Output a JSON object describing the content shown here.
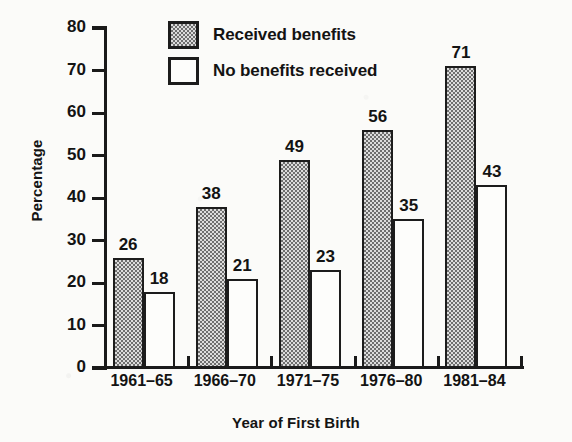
{
  "chart_data": {
    "type": "bar",
    "title": "",
    "subtitle": "",
    "xlabel": "Year of First Birth",
    "ylabel": "Percentage",
    "categories": [
      "1961–65",
      "1966–70",
      "1971–75",
      "1976–80",
      "1981–84"
    ],
    "series": [
      {
        "name": "Received benefits",
        "fill": "checkered-gray",
        "values": [
          26,
          38,
          49,
          56,
          71
        ]
      },
      {
        "name": "No benefits received",
        "fill": "white",
        "values": [
          18,
          21,
          23,
          35,
          43
        ]
      }
    ],
    "ylim": [
      0,
      80
    ],
    "ytick_values": [
      0,
      10,
      20,
      30,
      40,
      50,
      60,
      70,
      80
    ],
    "ytick_labels": [
      "0",
      "10",
      "20",
      "30",
      "40",
      "50",
      "60",
      "70",
      "80"
    ],
    "grid": false,
    "legend_position": "top-center",
    "data_labels": true,
    "colors": {
      "axis": "#1a1a1a",
      "text": "#131313",
      "series_received_benefits": "#a5a5a5",
      "series_no_benefits_received": "#fdfdfb",
      "background": "#fbfbf9"
    }
  },
  "legend": {
    "items": [
      {
        "label": "Received benefits"
      },
      {
        "label": "No benefits received"
      }
    ]
  },
  "axes": {
    "y_title": "Percentage",
    "x_title": "Year of First Birth"
  }
}
